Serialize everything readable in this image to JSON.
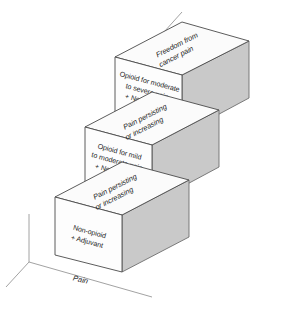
{
  "figure": {
    "name": "WHO analgesic ladder",
    "background_color": "#ffffff",
    "side_face_color": "#c9c9c9",
    "front_face_color": "#fdfdfd",
    "outline_color": "#4a4a4a",
    "text_color": "#1d1d1d"
  },
  "baseline": {
    "label": "Pain"
  },
  "steps": [
    {
      "id": "step-1",
      "level": "1",
      "top_label_lines": [
        "Pain persisting",
        "or increasing"
      ],
      "front_lines": [
        "Non-opioid",
        "+ Adjuvant"
      ]
    },
    {
      "id": "step-2",
      "level": "2",
      "top_label_lines": [
        "Pain persisting",
        "or increasing"
      ],
      "front_lines": [
        "Opioid for mild",
        "to moderate pain",
        "+ Non-opioid",
        "+ Adjuvant"
      ]
    },
    {
      "id": "step-3",
      "level": "3",
      "top_label_lines": [
        "Freedom from",
        "cancer pain"
      ],
      "front_lines": [
        "Opioid for moderate",
        "to severe pain",
        "+ Non-opioid",
        "+ Adjuvant"
      ]
    }
  ]
}
